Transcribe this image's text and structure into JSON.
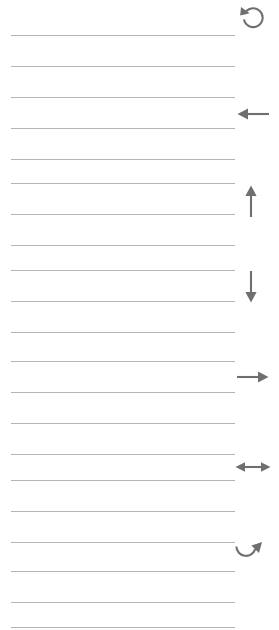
{
  "page": {
    "width": 279,
    "height": 630,
    "background_color": "#ffffff"
  },
  "ruled_lines": {
    "description": "Horizontal ruled writing lines",
    "color": "#b5b5b5",
    "thickness_px": 1,
    "count": 20,
    "left_x": 11,
    "items": [
      {
        "index": 1,
        "y": 35,
        "x": 11,
        "width": 224
      },
      {
        "index": 2,
        "y": 66,
        "x": 11,
        "width": 224
      },
      {
        "index": 3,
        "y": 97,
        "x": 11,
        "width": 224
      },
      {
        "index": 4,
        "y": 128,
        "x": 11,
        "width": 224
      },
      {
        "index": 5,
        "y": 159,
        "x": 11,
        "width": 224
      },
      {
        "index": 6,
        "y": 183,
        "x": 11,
        "width": 224
      },
      {
        "index": 7,
        "y": 214,
        "x": 11,
        "width": 224
      },
      {
        "index": 8,
        "y": 245,
        "x": 11,
        "width": 224
      },
      {
        "index": 9,
        "y": 270,
        "x": 11,
        "width": 224
      },
      {
        "index": 10,
        "y": 301,
        "x": 11,
        "width": 224
      },
      {
        "index": 11,
        "y": 332,
        "x": 11,
        "width": 224
      },
      {
        "index": 12,
        "y": 361,
        "x": 11,
        "width": 224
      },
      {
        "index": 13,
        "y": 392,
        "x": 11,
        "width": 224
      },
      {
        "index": 14,
        "y": 423,
        "x": 11,
        "width": 224
      },
      {
        "index": 15,
        "y": 454,
        "x": 11,
        "width": 224
      },
      {
        "index": 16,
        "y": 480,
        "x": 11,
        "width": 224
      },
      {
        "index": 17,
        "y": 511,
        "x": 11,
        "width": 224
      },
      {
        "index": 18,
        "y": 542,
        "x": 11,
        "width": 224
      },
      {
        "index": 19,
        "y": 571,
        "x": 11,
        "width": 224
      },
      {
        "index": 20,
        "y": 602,
        "x": 11,
        "width": 224
      },
      {
        "index": 21,
        "y": 627,
        "x": 11,
        "width": 224
      }
    ]
  },
  "margin_icons": {
    "description": "Gray direction and rotation glyphs in the right margin",
    "color": "#6f6f6f",
    "items": [
      {
        "index": 0,
        "name": "rotate-counterclockwise-icon",
        "glyph": "counterclockwise circular arrow",
        "x": 239,
        "y": 3,
        "size": 28
      },
      {
        "index": 1,
        "name": "arrow-left-icon",
        "glyph": "left pointing arrow",
        "x": 236,
        "y": 100,
        "size": 28
      },
      {
        "index": 2,
        "name": "arrow-up-icon",
        "glyph": "up pointing arrow",
        "x": 240,
        "y": 184,
        "size": 28
      },
      {
        "index": 3,
        "name": "arrow-down-icon",
        "glyph": "down pointing arrow",
        "x": 240,
        "y": 270,
        "size": 28
      },
      {
        "index": 4,
        "name": "arrow-right-icon",
        "glyph": "right pointing arrow",
        "x": 236,
        "y": 363,
        "size": 28
      },
      {
        "index": 5,
        "name": "arrow-left-right-icon",
        "glyph": "double headed horizontal arrow",
        "x": 234,
        "y": 453,
        "size": 28
      },
      {
        "index": 6,
        "name": "rotate-clockwise-icon",
        "glyph": "clockwise curved arrow",
        "x": 233,
        "y": 540,
        "size": 28
      }
    ]
  }
}
